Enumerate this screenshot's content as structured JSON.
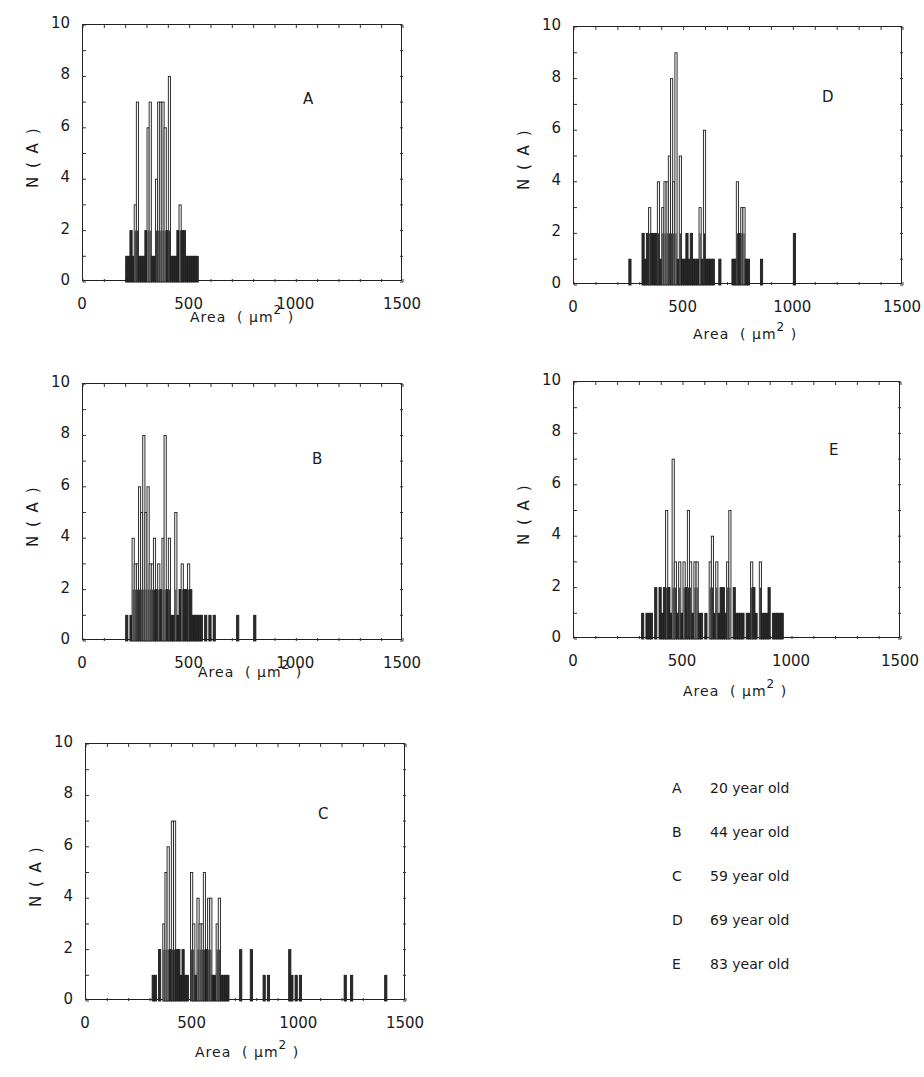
{
  "figure": {
    "ylabel": "N ( A )",
    "xlabel_prefix": "Area  ( μm",
    "xlabel_sup": "2",
    "xlabel_suffix": " )",
    "yticks": [
      "0",
      "2",
      "4",
      "6",
      "8",
      "10"
    ],
    "xticks": [
      "0",
      "500",
      "1000",
      "1500"
    ]
  },
  "legend": [
    {
      "key": "A",
      "label": "20 year old"
    },
    {
      "key": "B",
      "label": "44 year old"
    },
    {
      "key": "C",
      "label": "59 year old"
    },
    {
      "key": "D",
      "label": "69 year old"
    },
    {
      "key": "E",
      "label": "83 year old"
    }
  ],
  "chart_data": [
    {
      "type": "bar",
      "panel": "A",
      "title": "A",
      "xlabel": "Area (μm²)",
      "ylabel": "N (A)",
      "xlim": [
        0,
        1500
      ],
      "ylim": [
        0,
        10
      ],
      "bin_width": 10,
      "x": [
        200,
        210,
        220,
        230,
        240,
        250,
        260,
        270,
        280,
        290,
        300,
        310,
        320,
        330,
        340,
        350,
        360,
        370,
        380,
        390,
        400,
        410,
        420,
        430,
        440,
        450,
        460,
        470,
        480,
        490,
        500,
        510,
        520,
        530
      ],
      "values": [
        1,
        1,
        2,
        1,
        3,
        7,
        1,
        1,
        1,
        2,
        6,
        7,
        1,
        1,
        4,
        7,
        7,
        7,
        6,
        2,
        8,
        1,
        1,
        1,
        2,
        3,
        2,
        2,
        1,
        1,
        1,
        1,
        1,
        1
      ]
    },
    {
      "type": "bar",
      "panel": "B",
      "title": "B",
      "xlabel": "Area (μm²)",
      "ylabel": "N (A)",
      "xlim": [
        0,
        1500
      ],
      "ylim": [
        0,
        10
      ],
      "bin_width": 10,
      "x": [
        200,
        220,
        230,
        240,
        250,
        260,
        270,
        280,
        290,
        300,
        310,
        320,
        330,
        340,
        350,
        360,
        370,
        380,
        390,
        400,
        410,
        420,
        430,
        440,
        450,
        460,
        470,
        480,
        490,
        500,
        510,
        520,
        530,
        540,
        550,
        570,
        590,
        610,
        720,
        800
      ],
      "values": [
        1,
        1,
        4,
        3,
        3,
        6,
        5,
        8,
        5,
        6,
        3,
        3,
        4,
        2,
        3,
        2,
        4,
        8,
        2,
        4,
        1,
        1,
        5,
        1,
        2,
        3,
        2,
        2,
        3,
        2,
        1,
        1,
        1,
        1,
        1,
        1,
        1,
        1,
        1,
        1
      ]
    },
    {
      "type": "bar",
      "panel": "C",
      "title": "C",
      "xlabel": "Area (μm²)",
      "ylabel": "N (A)",
      "xlim": [
        0,
        1500
      ],
      "ylim": [
        0,
        10
      ],
      "bin_width": 10,
      "x": [
        310,
        320,
        340,
        360,
        370,
        380,
        390,
        400,
        410,
        420,
        430,
        440,
        450,
        460,
        470,
        490,
        500,
        510,
        520,
        530,
        540,
        550,
        560,
        570,
        580,
        590,
        600,
        610,
        620,
        630,
        640,
        650,
        660,
        720,
        770,
        830,
        850,
        950,
        960,
        980,
        1000,
        1210,
        1240,
        1400
      ],
      "values": [
        1,
        1,
        2,
        3,
        5,
        6,
        2,
        7,
        7,
        2,
        2,
        1,
        2,
        1,
        1,
        5,
        3,
        1,
        4,
        3,
        3,
        5,
        2,
        4,
        4,
        1,
        1,
        3,
        4,
        1,
        1,
        1,
        1,
        2,
        2,
        1,
        1,
        2,
        1,
        1,
        1,
        1,
        1,
        1
      ]
    },
    {
      "type": "bar",
      "panel": "D",
      "title": "D",
      "xlabel": "Area (μm²)",
      "ylabel": "N (A)",
      "xlim": [
        0,
        1500
      ],
      "ylim": [
        0,
        10
      ],
      "bin_width": 10,
      "x": [
        250,
        310,
        320,
        330,
        340,
        350,
        360,
        370,
        380,
        390,
        400,
        410,
        420,
        430,
        440,
        450,
        460,
        470,
        480,
        490,
        500,
        510,
        520,
        530,
        540,
        550,
        560,
        570,
        580,
        590,
        600,
        610,
        620,
        630,
        660,
        720,
        730,
        740,
        750,
        760,
        770,
        780,
        790,
        850,
        1000
      ],
      "values": [
        1,
        2,
        1,
        2,
        3,
        2,
        2,
        2,
        4,
        1,
        3,
        4,
        4,
        5,
        8,
        4,
        9,
        1,
        5,
        1,
        1,
        2,
        1,
        2,
        1,
        1,
        1,
        3,
        1,
        6,
        1,
        1,
        1,
        1,
        1,
        1,
        1,
        4,
        2,
        3,
        3,
        1,
        1,
        1,
        2
      ]
    },
    {
      "type": "bar",
      "panel": "E",
      "title": "E",
      "xlabel": "Area (μm²)",
      "ylabel": "N (A)",
      "xlim": [
        0,
        1500
      ],
      "ylim": [
        0,
        10
      ],
      "bin_width": 10,
      "x": [
        310,
        330,
        340,
        350,
        370,
        390,
        400,
        410,
        420,
        430,
        440,
        450,
        460,
        470,
        480,
        490,
        500,
        510,
        520,
        530,
        540,
        550,
        560,
        570,
        580,
        600,
        620,
        630,
        640,
        650,
        660,
        670,
        680,
        690,
        700,
        710,
        730,
        740,
        750,
        760,
        770,
        790,
        800,
        810,
        820,
        830,
        850,
        860,
        870,
        880,
        890,
        910,
        920,
        930,
        940,
        950
      ],
      "values": [
        1,
        1,
        1,
        1,
        2,
        2,
        1,
        2,
        5,
        2,
        1,
        7,
        3,
        1,
        3,
        1,
        3,
        2,
        5,
        3,
        1,
        3,
        3,
        1,
        1,
        1,
        3,
        4,
        1,
        3,
        1,
        2,
        2,
        1,
        3,
        5,
        2,
        1,
        1,
        1,
        1,
        1,
        1,
        3,
        2,
        1,
        3,
        1,
        1,
        1,
        2,
        1,
        1,
        1,
        1,
        1
      ]
    }
  ]
}
